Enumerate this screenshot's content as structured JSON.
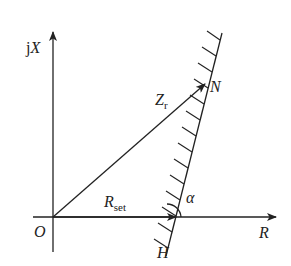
{
  "diagram": {
    "axes": {
      "vertical_label_prefix": "j",
      "vertical_label": "X",
      "horizontal_label": "R",
      "origin_label": "O"
    },
    "points": {
      "N": "N",
      "H": "H"
    },
    "vectors": {
      "zr_main": "Z",
      "zr_sub": "r",
      "rset_main": "R",
      "rset_sub": "set"
    },
    "angle_label": "α",
    "colors": {
      "stroke": "#222222",
      "background": "#ffffff"
    }
  }
}
